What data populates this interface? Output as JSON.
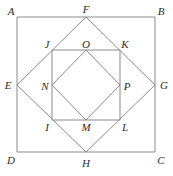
{
  "figure": {
    "stroke_color": "#8a8a8a",
    "label_color": "#2b2b2b",
    "background_color": "#ffffff",
    "stroke_width": 1,
    "canvas": {
      "width": 173,
      "height": 176
    },
    "shapes": [
      {
        "name": "outer-square",
        "type": "polygon",
        "vertices": [
          "A",
          "B",
          "C",
          "D"
        ],
        "points": "17,17 155,17 155,152 17,152"
      },
      {
        "name": "outer-diamond",
        "type": "polygon",
        "vertices": [
          "F",
          "G",
          "H",
          "E"
        ],
        "points": "86,17 155,85 86,152 17,85"
      },
      {
        "name": "inner-square",
        "type": "polygon",
        "vertices": [
          "J",
          "K",
          "L",
          "I"
        ],
        "points": "52,50 120,50 120,120 52,120"
      },
      {
        "name": "inner-diamond",
        "type": "polygon",
        "vertices": [
          "O",
          "P",
          "M",
          "N"
        ],
        "points": "86,50 120,85 86,120 52,85"
      }
    ],
    "labels": [
      {
        "id": "A",
        "text": "A",
        "x": 11,
        "y": 11,
        "role": "outer-square-corner-top-left"
      },
      {
        "id": "B",
        "text": "B",
        "x": 161,
        "y": 11,
        "role": "outer-square-corner-top-right"
      },
      {
        "id": "C",
        "text": "C",
        "x": 161,
        "y": 160,
        "role": "outer-square-corner-bottom-right"
      },
      {
        "id": "D",
        "text": "D",
        "x": 11,
        "y": 160,
        "role": "outer-square-corner-bottom-left"
      },
      {
        "id": "E",
        "text": "E",
        "x": 8,
        "y": 85,
        "role": "outer-diamond-vertex-left"
      },
      {
        "id": "F",
        "text": "F",
        "x": 86,
        "y": 9,
        "role": "outer-diamond-vertex-top"
      },
      {
        "id": "G",
        "text": "G",
        "x": 164,
        "y": 85,
        "role": "outer-diamond-vertex-right"
      },
      {
        "id": "H",
        "text": "H",
        "x": 86,
        "y": 163,
        "role": "outer-diamond-vertex-bottom"
      },
      {
        "id": "J",
        "text": "J",
        "x": 47,
        "y": 44,
        "role": "inner-square-corner-top-left"
      },
      {
        "id": "K",
        "text": "K",
        "x": 125,
        "y": 44,
        "role": "inner-square-corner-top-right"
      },
      {
        "id": "L",
        "text": "L",
        "x": 125,
        "y": 127,
        "role": "inner-square-corner-bottom-right"
      },
      {
        "id": "I",
        "text": "I",
        "x": 47,
        "y": 127,
        "role": "inner-square-corner-bottom-left"
      },
      {
        "id": "N",
        "text": "N",
        "x": 45,
        "y": 86,
        "role": "inner-diamond-vertex-left"
      },
      {
        "id": "O",
        "text": "O",
        "x": 86,
        "y": 44,
        "role": "inner-diamond-vertex-top"
      },
      {
        "id": "P",
        "text": "P",
        "x": 127,
        "y": 86,
        "role": "inner-diamond-vertex-right"
      },
      {
        "id": "M",
        "text": "M",
        "x": 86,
        "y": 127,
        "role": "inner-diamond-vertex-bottom"
      }
    ]
  }
}
